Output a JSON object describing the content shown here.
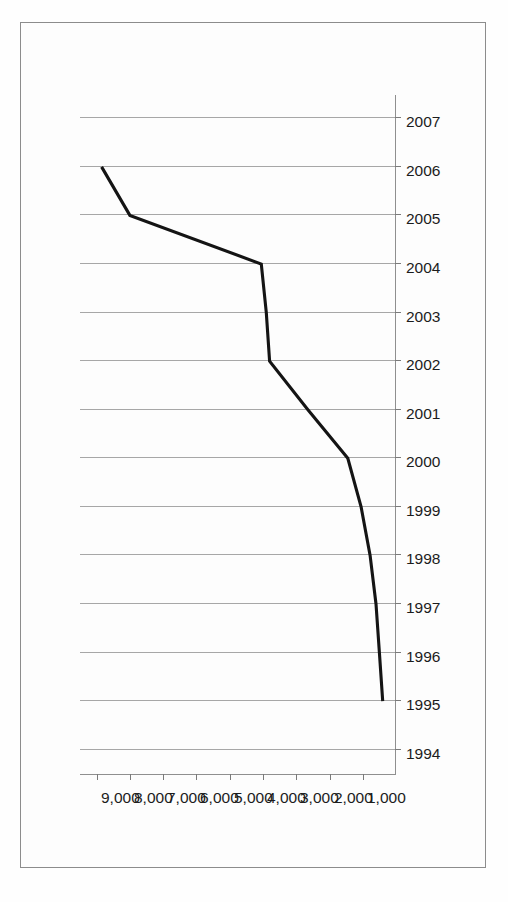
{
  "figure": {
    "background_color": "#fdfdfd",
    "frame_color": "#8c8c8c",
    "orientation": "rotated-90"
  },
  "chart_data": {
    "type": "line",
    "title": "",
    "subtitle": "",
    "xlabel": "",
    "ylabel": "",
    "categories": [
      "1994",
      "1995",
      "1996",
      "1997",
      "1998",
      "1999",
      "2000",
      "2001",
      "2002",
      "2003",
      "2004",
      "2005",
      "2006",
      "2007"
    ],
    "x_tick_labels": [
      "1994",
      "1995",
      "1996",
      "1997",
      "1998",
      "1999",
      "2000",
      "2001",
      "2002",
      "2003",
      "2004",
      "2005",
      "2006",
      "2007"
    ],
    "y_tick_labels": [
      "9,000",
      "8,000",
      "7,000",
      "6,000",
      "5,000",
      "4,000",
      "3,000",
      "2,000",
      "1,000"
    ],
    "y_tick_values": [
      9000,
      8000,
      7000,
      6000,
      5000,
      4000,
      3000,
      2000,
      1000
    ],
    "ylim": [
      0,
      9500
    ],
    "grid": "vertical-gridlines-on-value-axis",
    "legend": "none",
    "series": [
      {
        "name": "series-1",
        "color": "#141414",
        "x": [
          "1995",
          "1996",
          "1997",
          "1998",
          "1999",
          "2000",
          "2001",
          "2002",
          "2003",
          "2004",
          "2005",
          "2006"
        ],
        "values": [
          400,
          500,
          600,
          780,
          1050,
          1450,
          2650,
          3800,
          3900,
          4050,
          8000,
          8850
        ]
      }
    ],
    "annotations": []
  }
}
